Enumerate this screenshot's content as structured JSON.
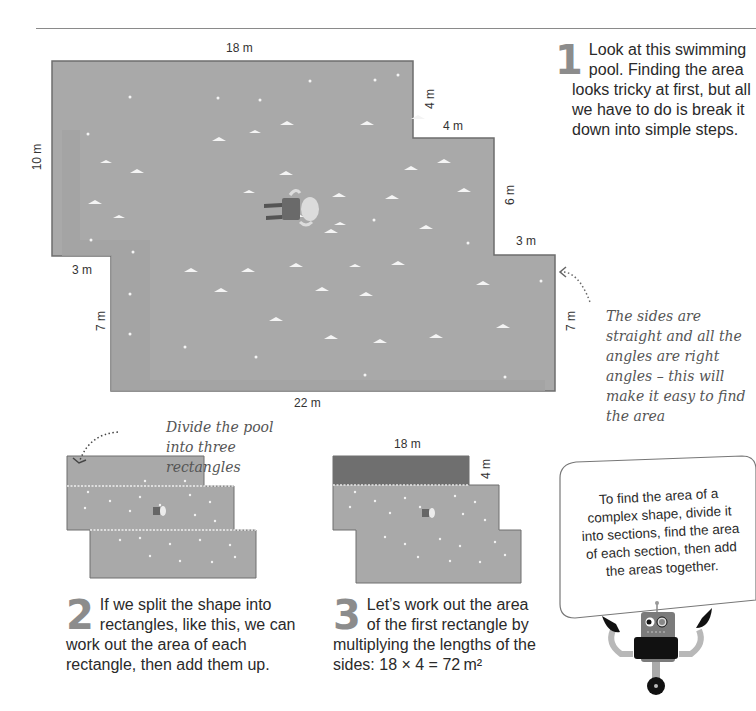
{
  "page": {
    "header_rule": true
  },
  "main_pool": {
    "dimensions": {
      "top": "18 m",
      "left": "10 m",
      "top_step_vertical": "4 m",
      "top_step_horizontal": "4 m",
      "right_upper": "6 m",
      "right_step": "3 m",
      "right_lower": "7 m",
      "left_step": "3 m",
      "left_lower": "7 m",
      "bottom": "22 m"
    },
    "colors": {
      "water": "#a9a9a9",
      "water_shallow": "#a2a2a2",
      "edge": "#6e6e6e",
      "wave": "#f4f4f4"
    }
  },
  "steps": [
    {
      "number": "1",
      "text": "Look at this swimming pool. Finding the area looks tricky at first, but all we have to do is break it down into simple steps."
    },
    {
      "number": "2",
      "text": "If we split the shape into rectangles, like this, we can work out the area of each rectangle, then add them up."
    },
    {
      "number": "3",
      "text": "Let’s work out the area of the first rectangle by multiplying the lengths of the sides: 18 × 4 = 72 m²"
    }
  ],
  "annotations": {
    "sides_note": "The sides are straight and all the angles are right angles – this will make it easy to find the area",
    "divide_note": "Divide the pool into three rectangles"
  },
  "step3_diagram": {
    "top_label": "18 m",
    "side_label": "4 m",
    "highlight_color": "#6f6f6f"
  },
  "callout": {
    "text": "To find the area of a complex shape, divide it into sections, find the area of each section, then add the areas together."
  },
  "icons": {
    "swimmer_robot": "swimming-robot-icon",
    "robot_mascot": "robot-mascot-icon",
    "dotted_arrow": "dotted-arrow-icon"
  }
}
